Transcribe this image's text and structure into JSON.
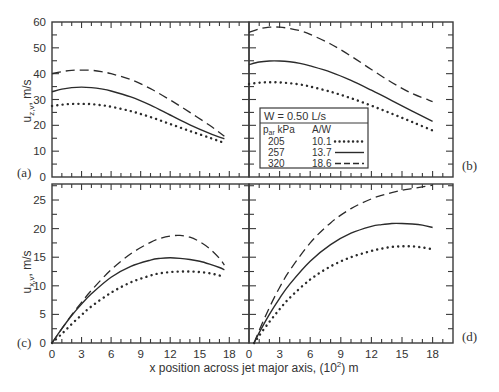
{
  "figure": {
    "xlabel": "x position across jet major axis, (10",
    "xlabel_sup": "2",
    "xlabel_tail": ") m",
    "top_ylabel_main": "u",
    "top_ylabel_sub": "z,v",
    "top_ylabel_unit": ", m/s",
    "bottom_ylabel_main": "u",
    "bottom_ylabel_sub": "x,v",
    "bottom_ylabel_unit": ", m/s",
    "panel_labels": [
      "(a)",
      "(b)",
      "(c)",
      "(d)"
    ],
    "legend": {
      "title": "W = 0.50 L/s",
      "col1_header_main": "p",
      "col1_header_sub": "ar",
      "col1_header_unit": " kPa",
      "col2_header": "A/W",
      "rows": [
        {
          "p": "205",
          "aw": "10.1",
          "style": "dotted"
        },
        {
          "p": "257",
          "aw": "13.7",
          "style": "solid"
        },
        {
          "p": "320",
          "aw": "18.6",
          "style": "dashed"
        }
      ]
    }
  },
  "chart_data": [
    {
      "type": "line",
      "panel": "(a)",
      "xlabel": "x position across jet major axis, (10^2) m",
      "ylabel": "u_z,v , m/s",
      "xlim": [
        0,
        20
      ],
      "ylim": [
        0,
        60
      ],
      "xticks": [
        0,
        3,
        6,
        9,
        12,
        15,
        18
      ],
      "yticks": [
        0,
        10,
        20,
        30,
        40,
        50,
        60
      ],
      "grid": false,
      "x": [
        0,
        1,
        2,
        3,
        4,
        5,
        6,
        8,
        10,
        12,
        14,
        16,
        17.5
      ],
      "series": [
        {
          "name": "205 kPa, A/W 10.1",
          "style": "dotted",
          "values": [
            27.5,
            28,
            28.3,
            28.3,
            28.2,
            27.8,
            27.2,
            25.5,
            23.2,
            20.5,
            17.8,
            15.2,
            13.2
          ]
        },
        {
          "name": "257 kPa, A/W 13.7",
          "style": "solid",
          "values": [
            33,
            34,
            34.6,
            34.8,
            34.6,
            34.1,
            33.3,
            31,
            27.8,
            24,
            20.2,
            16.9,
            14.8
          ]
        },
        {
          "name": "320 kPa, A/W 18.6",
          "style": "dashed",
          "values": [
            40,
            40.8,
            41.3,
            41.4,
            41.3,
            40.8,
            40,
            37.7,
            34.2,
            29.8,
            25,
            20,
            15.8
          ]
        }
      ]
    },
    {
      "type": "line",
      "panel": "(b)",
      "xlabel": "x position across jet major axis, (10^2) m",
      "ylabel": "u_z,v , m/s",
      "xlim": [
        0,
        20
      ],
      "ylim": [
        0,
        60
      ],
      "xticks": [
        0,
        3,
        6,
        9,
        12,
        15,
        18
      ],
      "yticks": [
        0,
        10,
        20,
        30,
        40,
        50,
        60
      ],
      "grid": false,
      "x": [
        0,
        1,
        2,
        3,
        4,
        5,
        6,
        8,
        10,
        12,
        14,
        16,
        18
      ],
      "series": [
        {
          "name": "205 kPa, A/W 10.1",
          "style": "dotted",
          "values": [
            36,
            36.5,
            36.7,
            36.6,
            36.3,
            35.8,
            35,
            33,
            30.5,
            27.6,
            24.5,
            21.3,
            18
          ]
        },
        {
          "name": "257 kPa, A/W 13.7",
          "style": "solid",
          "values": [
            43.5,
            44.5,
            44.9,
            44.9,
            44.6,
            44,
            43,
            40.6,
            37.4,
            33.6,
            29.6,
            25.5,
            21.5
          ]
        },
        {
          "name": "320 kPa, A/W 18.6",
          "style": "dashed",
          "values": [
            56,
            57.3,
            58,
            58,
            57.5,
            56.6,
            55.2,
            51.5,
            46.8,
            41.6,
            36.6,
            32.3,
            29.2
          ]
        }
      ]
    },
    {
      "type": "line",
      "panel": "(c)",
      "xlabel": "x position across jet major axis, (10^2) m",
      "ylabel": "u_x,v , m/s",
      "xlim": [
        0,
        20
      ],
      "ylim": [
        0,
        27.8
      ],
      "xticks": [
        0,
        3,
        6,
        9,
        12,
        15,
        18
      ],
      "yticks": [
        0,
        5,
        10,
        15,
        20,
        25
      ],
      "grid": false,
      "x": [
        0,
        1,
        2,
        3,
        4,
        6,
        8,
        10,
        11,
        12,
        13,
        14,
        15,
        16,
        17,
        17.5
      ],
      "series": [
        {
          "name": "205 kPa, A/W 10.1",
          "style": "dotted",
          "values": [
            0,
            1.6,
            3.3,
            4.9,
            6.4,
            8.8,
            10.6,
            11.8,
            12.2,
            12.4,
            12.5,
            12.5,
            12.4,
            12.2,
            11.8,
            11.5
          ]
        },
        {
          "name": "257 kPa, A/W 13.7",
          "style": "solid",
          "values": [
            0,
            2.5,
            4.8,
            6.8,
            8.6,
            11.5,
            13.4,
            14.5,
            14.8,
            14.9,
            14.8,
            14.6,
            14.3,
            13.8,
            13.2,
            12.8
          ]
        },
        {
          "name": "320 kPa, A/W 18.6",
          "style": "dashed",
          "values": [
            0,
            2.5,
            4.9,
            7.1,
            9.2,
            12.8,
            15.6,
            17.6,
            18.3,
            18.7,
            18.8,
            18.5,
            17.7,
            16.5,
            14.8,
            13.6
          ]
        }
      ]
    },
    {
      "type": "line",
      "panel": "(d)",
      "xlabel": "x position across jet major axis, (10^2) m",
      "ylabel": "u_x,v , m/s",
      "xlim": [
        0,
        20
      ],
      "ylim": [
        0,
        27.8
      ],
      "xticks": [
        0,
        3,
        6,
        9,
        12,
        15,
        18
      ],
      "yticks": [
        0,
        5,
        10,
        15,
        20,
        25
      ],
      "grid": false,
      "x": [
        0.5,
        1,
        2,
        3,
        4,
        6,
        8,
        10,
        12,
        13,
        14,
        15,
        16,
        17,
        18
      ],
      "series": [
        {
          "name": "205 kPa, A/W 10.1",
          "style": "dotted",
          "values": [
            0,
            1.3,
            3.7,
            5.9,
            7.9,
            11.1,
            13.4,
            15.0,
            16.1,
            16.5,
            16.8,
            16.9,
            16.9,
            16.7,
            16.4
          ]
        },
        {
          "name": "257 kPa, A/W 13.7",
          "style": "solid",
          "values": [
            0,
            1.8,
            5.0,
            7.8,
            10.3,
            14.3,
            17.2,
            19.2,
            20.4,
            20.7,
            20.9,
            20.9,
            20.8,
            20.6,
            20.2
          ]
        },
        {
          "name": "320 kPa, A/W 18.6",
          "style": "dashed",
          "values": [
            0,
            2.2,
            6.2,
            9.7,
            12.7,
            17.5,
            21.0,
            23.5,
            25.2,
            25.8,
            26.3,
            26.7,
            27.0,
            27.3,
            27.6
          ]
        }
      ]
    }
  ]
}
